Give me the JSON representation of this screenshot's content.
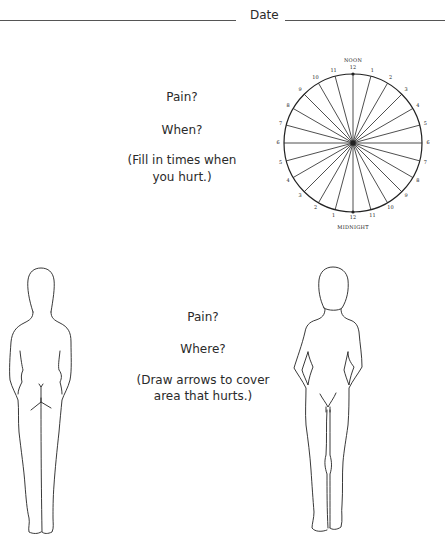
{
  "header": {
    "date_label": "Date"
  },
  "when_section": {
    "title": "Pain?",
    "question": "When?",
    "instruction_line1": "(Fill in times when",
    "instruction_line2": "you hurt.)"
  },
  "clock": {
    "top_caption": "NOON",
    "bottom_caption": "MIDNIGHT",
    "right_labels": [
      "12",
      "1",
      "2",
      "3",
      "4",
      "5",
      "6",
      "7",
      "8",
      "9",
      "10",
      "11"
    ],
    "left_labels": [
      "12",
      "1",
      "2",
      "3",
      "4",
      "5",
      "6",
      "7",
      "8",
      "9",
      "10",
      "11"
    ],
    "spokes": 24
  },
  "where_section": {
    "title": "Pain?",
    "question": "Where?",
    "instruction_line1": "(Draw arrows to cover",
    "instruction_line2": "area that hurts.)"
  },
  "figures": {
    "back_view": "back-body-outline",
    "front_view": "front-body-outline"
  }
}
